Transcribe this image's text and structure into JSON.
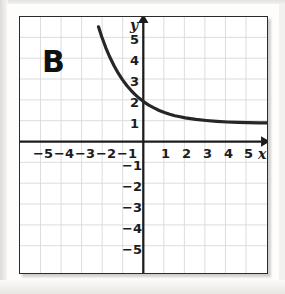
{
  "figure": {
    "panel_label": "B",
    "x_axis_name": "x",
    "y_axis_name": "y"
  },
  "chart_data": {
    "type": "line",
    "title": "B",
    "xlabel": "x",
    "ylabel": "y",
    "xlim": [
      -5.9,
      5.9
    ],
    "ylim": [
      -5.9,
      5.9
    ],
    "grid": true,
    "grid_step": 1,
    "legend": "none",
    "x_ticks": [
      -5,
      -4,
      -3,
      -2,
      -1,
      1,
      2,
      3,
      4,
      5
    ],
    "y_ticks": [
      5,
      4,
      3,
      2,
      1,
      -1,
      -2,
      -3,
      -4,
      -5
    ],
    "x_tick_labels": [
      "−5",
      "−4",
      "−3",
      "−2",
      "−1",
      "1",
      "2",
      "3",
      "4",
      "5"
    ],
    "y_tick_labels": [
      "5",
      "4",
      "3",
      "2",
      "1",
      "−1",
      "−2",
      "−3",
      "−4",
      "−5"
    ],
    "asymptote": 1,
    "y_intercept": 2,
    "series": [
      {
        "name": "exponential decay",
        "x": [
          -2.15,
          -2.0,
          -1.8,
          -1.6,
          -1.4,
          -1.2,
          -1.0,
          -0.8,
          -0.6,
          -0.4,
          -0.2,
          0.0,
          0.25,
          0.5,
          0.75,
          1.0,
          1.25,
          1.5,
          1.75,
          2.0,
          2.5,
          3.0,
          3.5,
          4.0,
          4.5,
          5.0,
          5.5,
          5.9
        ],
        "y": [
          5.45,
          5.0,
          4.48,
          4.03,
          3.64,
          3.3,
          3.0,
          2.74,
          2.52,
          2.32,
          2.15,
          2.0,
          1.84,
          1.71,
          1.59,
          1.5,
          1.42,
          1.35,
          1.3,
          1.25,
          1.18,
          1.13,
          1.09,
          1.06,
          1.04,
          1.03,
          1.02,
          1.02
        ]
      }
    ]
  }
}
